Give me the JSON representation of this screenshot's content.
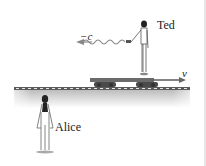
{
  "figure": {
    "labels": {
      "ted": "Ted",
      "alice": "Alice",
      "light_velocity": "−c",
      "car_velocity": "v"
    },
    "colors": {
      "ground": "#9a9a9a",
      "track": "#555555",
      "car": "#6b6b6b",
      "light_wave": "#8a8a8a",
      "text": "#222222"
    }
  }
}
